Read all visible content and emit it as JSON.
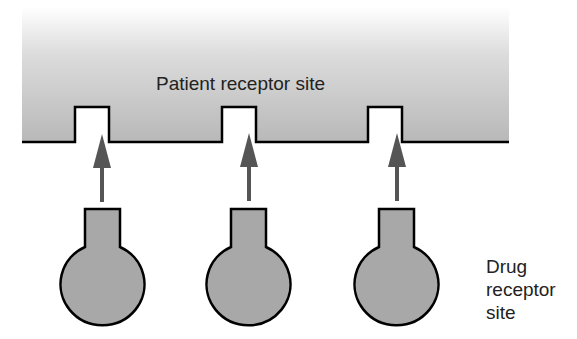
{
  "diagram": {
    "patient_receptor": {
      "label": "Patient receptor site",
      "notches_count": 3
    },
    "drug_receptor": {
      "label_lines": [
        "Drug",
        "receptor",
        "site"
      ],
      "count": 3
    },
    "arrows_count": 3
  },
  "colors": {
    "receptor_fill_top": "#ffffff",
    "receptor_fill_bottom": "#b8b8b8",
    "drug_fill": "#a8a8a8",
    "arrow": "#555555",
    "outline": "#000000",
    "text": "#222222"
  }
}
